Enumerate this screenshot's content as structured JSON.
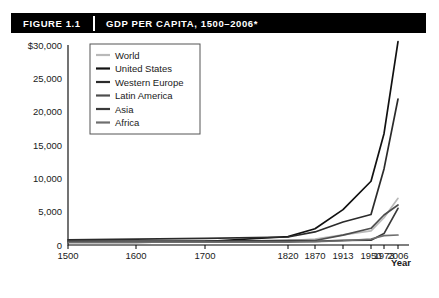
{
  "header": {
    "figure_label": "FIGURE 1.1",
    "title": "GDP PER CAPITA, 1500–2006*"
  },
  "axes": {
    "x_axis_title": "Year",
    "y_axis_tick_labels": [
      "$30,000",
      "25,000",
      "20,000",
      "15,000",
      "10,000",
      "5,000",
      "0"
    ],
    "x_axis_tick_labels": [
      "1500",
      "1600",
      "1700",
      "1820",
      "1870",
      "1913",
      "1950",
      "1973",
      "2006"
    ]
  },
  "legend": {
    "position": "top-left-inside",
    "entries": [
      {
        "label": "World",
        "color": "#b9b9b9"
      },
      {
        "label": "United States",
        "color": "#111111"
      },
      {
        "label": "Western Europe",
        "color": "#2b2b2b"
      },
      {
        "label": "Latin America",
        "color": "#4d4d4d"
      },
      {
        "label": "Asia",
        "color": "#3a3a3a"
      },
      {
        "label": "Africa",
        "color": "#6e6e6e"
      }
    ]
  },
  "chart_data": {
    "type": "line",
    "title": "GDP PER CAPITA, 1500–2006*",
    "xlabel": "Year",
    "ylabel": "",
    "categories": [
      "1500",
      "1600",
      "1700",
      "1820",
      "1870",
      "1913",
      "1950",
      "1973",
      "2006"
    ],
    "x_scale": "categorical-uneven",
    "x_positions": [
      68,
      136,
      205,
      288,
      315,
      343,
      371,
      384,
      398
    ],
    "ylim": [
      0,
      30000
    ],
    "yticks": [
      0,
      5000,
      10000,
      15000,
      20000,
      25000,
      30000
    ],
    "grid": false,
    "series": [
      {
        "name": "World",
        "color": "#b9b9b9",
        "values": [
          566,
          596,
          616,
          667,
          870,
          1525,
          2111,
          4091,
          7000
        ]
      },
      {
        "name": "United States",
        "color": "#111111",
        "values": [
          400,
          400,
          527,
          1257,
          2445,
          5301,
          9561,
          16689,
          30500
        ]
      },
      {
        "name": "Western Europe",
        "color": "#2b2b2b",
        "values": [
          771,
          889,
          997,
          1202,
          1960,
          3457,
          4578,
          11416,
          21900
        ]
      },
      {
        "name": "Latin America",
        "color": "#4d4d4d",
        "values": [
          416,
          438,
          527,
          691,
          676,
          1481,
          2506,
          4504,
          6000
        ]
      },
      {
        "name": "Asia",
        "color": "#3a3a3a",
        "values": [
          572,
          576,
          572,
          581,
          556,
          696,
          717,
          1718,
          5500
        ]
      },
      {
        "name": "Africa",
        "color": "#6e6e6e",
        "values": [
          414,
          422,
          421,
          420,
          500,
          637,
          894,
          1410,
          1500
        ]
      }
    ]
  }
}
